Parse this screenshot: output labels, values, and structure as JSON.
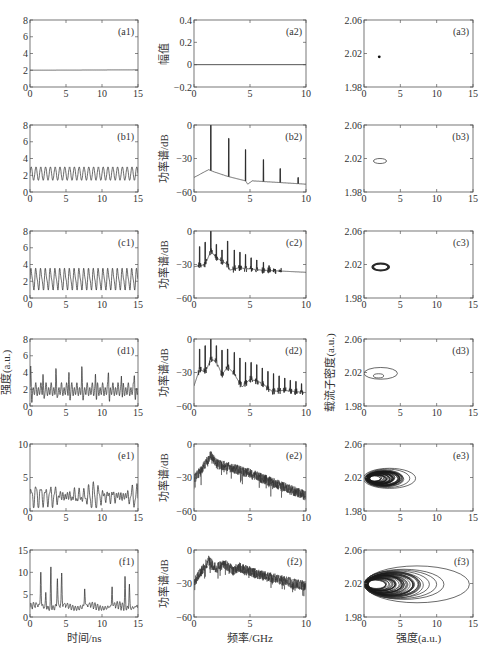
{
  "figure": {
    "rows": [
      "a",
      "b",
      "c",
      "d",
      "e",
      "f"
    ],
    "row_tops": [
      20,
      125,
      231,
      339,
      444,
      550
    ],
    "plot_height": 67,
    "columns": [
      {
        "left": 30,
        "width": 108,
        "type": "time_series",
        "xlabel": "时间/ns",
        "xticks": [
          0,
          5,
          10,
          15
        ],
        "xlim": [
          0,
          15
        ]
      },
      {
        "left": 194,
        "width": 112,
        "type": "power_spectrum",
        "xlabel": "频率/GHz",
        "xticks": [
          0,
          5,
          10
        ],
        "xlim": [
          0,
          10
        ]
      },
      {
        "left": 364,
        "width": 109,
        "type": "phase_portrait",
        "xlabel": "强度(a.u.)",
        "xticks": [
          0,
          5,
          10,
          15
        ],
        "xlim": [
          0,
          15
        ]
      }
    ]
  },
  "chart_data": [
    {
      "id": "a1",
      "type": "line",
      "panel_label": "(a1)",
      "xlabel": "",
      "ylabel": "",
      "xlim": [
        0,
        15
      ],
      "ylim": [
        0,
        8
      ],
      "yticks": [
        0,
        2,
        4,
        6,
        8
      ],
      "xticks": [
        0,
        5,
        10,
        15
      ],
      "description": "constant intensity",
      "series": [
        {
          "name": "intensity",
          "x": [
            0,
            15
          ],
          "y": [
            2.0,
            2.05
          ]
        }
      ]
    },
    {
      "id": "a2",
      "type": "line",
      "panel_label": "(a2)",
      "ylabel": "幅值",
      "xlim": [
        0,
        10
      ],
      "ylim": [
        -0.2,
        0.4
      ],
      "yticks": [
        -0.2,
        0,
        0.2,
        0.4
      ],
      "xticks": [
        0,
        5,
        10
      ],
      "series": [
        {
          "name": "amplitude",
          "x": [
            0,
            10
          ],
          "y": [
            0,
            0
          ]
        }
      ]
    },
    {
      "id": "a3",
      "type": "scatter",
      "panel_label": "(a3)",
      "xlim": [
        0,
        15
      ],
      "ylim": [
        1.98,
        2.06
      ],
      "yticks": [
        1.98,
        2.02,
        2.06
      ],
      "xticks": [
        0,
        5,
        10,
        15
      ],
      "series": [
        {
          "name": "fixed point",
          "x": [
            2.1
          ],
          "y": [
            2.016
          ]
        }
      ]
    },
    {
      "id": "b1",
      "type": "line",
      "panel_label": "(b1)",
      "xlim": [
        0,
        15
      ],
      "ylim": [
        0,
        8
      ],
      "yticks": [
        0,
        2,
        4,
        6,
        8
      ],
      "xticks": [
        0,
        5,
        10,
        15
      ],
      "description": "period-1 oscillation",
      "oscillation": {
        "min": 1.4,
        "max": 3.0,
        "frequency_ghz": 1.5
      }
    },
    {
      "id": "b2",
      "type": "line",
      "panel_label": "(b2)",
      "ylabel": "功率谱/dB",
      "xlim": [
        0,
        10
      ],
      "ylim": [
        -60,
        0
      ],
      "yticks": [
        -60,
        -30,
        0
      ],
      "xticks": [
        0,
        5,
        10
      ],
      "peaks": [
        {
          "f": 1.5,
          "db": 0
        },
        {
          "f": 3.1,
          "db": -12
        },
        {
          "f": 4.6,
          "db": -22
        },
        {
          "f": 6.2,
          "db": -31
        },
        {
          "f": 7.7,
          "db": -39
        },
        {
          "f": 9.3,
          "db": -47
        }
      ],
      "floor": [
        {
          "f": 0,
          "db": -47
        },
        {
          "f": 1.3,
          "db": -40
        },
        {
          "f": 1.8,
          "db": -42
        },
        {
          "f": 3.0,
          "db": -46
        },
        {
          "f": 4.6,
          "db": -50
        },
        {
          "f": 4.8,
          "db": -53
        },
        {
          "f": 5.2,
          "db": -50
        },
        {
          "f": 10,
          "db": -53
        }
      ]
    },
    {
      "id": "b3",
      "type": "line",
      "panel_label": "(b3)",
      "xlim": [
        0,
        15
      ],
      "ylim": [
        1.98,
        2.06
      ],
      "yticks": [
        1.98,
        2.02,
        2.06
      ],
      "xticks": [
        0,
        5,
        10,
        15
      ],
      "orbits": [
        {
          "cx": 2.2,
          "cy": 2.017,
          "rx": 0.9,
          "ry": 0.003
        }
      ]
    },
    {
      "id": "c1",
      "type": "line",
      "panel_label": "(c1)",
      "xlim": [
        0,
        15
      ],
      "ylim": [
        0,
        8
      ],
      "yticks": [
        0,
        2,
        4,
        6,
        8
      ],
      "xticks": [
        0,
        5,
        10,
        15
      ],
      "description": "period-1 oscillation larger amplitude",
      "oscillation": {
        "min": 1.1,
        "max": 3.4,
        "frequency_ghz": 1.5
      }
    },
    {
      "id": "c2",
      "type": "line",
      "panel_label": "(c2)",
      "ylabel": "功率谱/dB",
      "xlim": [
        0,
        10
      ],
      "ylim": [
        -60,
        0
      ],
      "yticks": [
        -60,
        -30,
        0
      ],
      "xticks": [
        0,
        5,
        10
      ],
      "peaks": [
        {
          "f": 0.5,
          "db": -14
        },
        {
          "f": 1.0,
          "db": -10
        },
        {
          "f": 1.5,
          "db": 0
        },
        {
          "f": 2.0,
          "db": -12
        },
        {
          "f": 2.5,
          "db": -17
        },
        {
          "f": 3.0,
          "db": -9
        },
        {
          "f": 3.6,
          "db": -17
        },
        {
          "f": 4.1,
          "db": -19
        },
        {
          "f": 4.6,
          "db": -21
        },
        {
          "f": 5.1,
          "db": -24
        },
        {
          "f": 5.6,
          "db": -26
        },
        {
          "f": 6.2,
          "db": -28
        },
        {
          "f": 6.7,
          "db": -31
        },
        {
          "f": 7.2,
          "db": -34
        },
        {
          "f": 7.7,
          "db": -35
        }
      ],
      "floor": [
        {
          "f": 0,
          "db": -32
        },
        {
          "f": 1.0,
          "db": -30
        },
        {
          "f": 1.5,
          "db": -18
        },
        {
          "f": 2.0,
          "db": -24
        },
        {
          "f": 3.0,
          "db": -30
        },
        {
          "f": 3.2,
          "db": -35
        },
        {
          "f": 4,
          "db": -33
        },
        {
          "f": 6,
          "db": -35
        },
        {
          "f": 10,
          "db": -37
        }
      ]
    },
    {
      "id": "c3",
      "type": "line",
      "panel_label": "(c3)",
      "xlim": [
        0,
        15
      ],
      "ylim": [
        1.98,
        2.06
      ],
      "yticks": [
        1.98,
        2.02,
        2.06
      ],
      "xticks": [
        0,
        5,
        10,
        15
      ],
      "orbits": [
        {
          "cx": 2.3,
          "cy": 2.017,
          "rx": 1.1,
          "ry": 0.004
        },
        {
          "cx": 2.3,
          "cy": 2.017,
          "rx": 1.2,
          "ry": 0.0045
        },
        {
          "cx": 2.3,
          "cy": 2.017,
          "rx": 1.0,
          "ry": 0.0038
        }
      ]
    },
    {
      "id": "d1",
      "type": "line",
      "panel_label": "(d1)",
      "ylabel": "强度(a.u.)",
      "xlim": [
        0,
        15
      ],
      "ylim": [
        0,
        8
      ],
      "yticks": [
        0,
        2,
        4,
        6,
        8
      ],
      "xticks": [
        0,
        5,
        10,
        15
      ],
      "description": "period doubling with spikes",
      "spike_times": [
        0.1,
        1.8,
        3.6,
        5.4,
        7.2,
        9.1,
        10.9,
        12.7,
        14.5
      ],
      "spike_height": 4.2,
      "base": {
        "min": 1.0,
        "max": 2.8
      }
    },
    {
      "id": "d2",
      "type": "line",
      "panel_label": "(d2)",
      "ylabel": "功率谱/dB",
      "xlim": [
        0,
        10
      ],
      "ylim": [
        -60,
        0
      ],
      "yticks": [
        -60,
        -30,
        0
      ],
      "xticks": [
        0,
        5,
        10
      ],
      "peaks": [
        {
          "f": 0.5,
          "db": -9
        },
        {
          "f": 1.0,
          "db": -6
        },
        {
          "f": 1.5,
          "db": 0
        },
        {
          "f": 2.0,
          "db": -6
        },
        {
          "f": 2.5,
          "db": -10
        },
        {
          "f": 3.0,
          "db": -9
        },
        {
          "f": 3.6,
          "db": -12
        },
        {
          "f": 4.1,
          "db": -17
        },
        {
          "f": 4.6,
          "db": -21
        },
        {
          "f": 5.1,
          "db": -21
        },
        {
          "f": 5.6,
          "db": -23
        },
        {
          "f": 6.1,
          "db": -26
        },
        {
          "f": 6.6,
          "db": -29
        },
        {
          "f": 7.1,
          "db": -31
        },
        {
          "f": 7.6,
          "db": -33
        },
        {
          "f": 8.1,
          "db": -35
        },
        {
          "f": 8.6,
          "db": -37
        },
        {
          "f": 9.1,
          "db": -38
        },
        {
          "f": 9.6,
          "db": -40
        }
      ],
      "floor": [
        {
          "f": 0,
          "db": -42
        },
        {
          "f": 0.5,
          "db": -27
        },
        {
          "f": 1,
          "db": -30
        },
        {
          "f": 1.5,
          "db": -18
        },
        {
          "f": 2,
          "db": -20
        },
        {
          "f": 2.5,
          "db": -32
        },
        {
          "f": 3,
          "db": -25
        },
        {
          "f": 3.5,
          "db": -30
        },
        {
          "f": 4.3,
          "db": -43
        },
        {
          "f": 5,
          "db": -36
        },
        {
          "f": 6,
          "db": -39
        },
        {
          "f": 7,
          "db": -47
        },
        {
          "f": 8,
          "db": -46
        },
        {
          "f": 10,
          "db": -48
        }
      ]
    },
    {
      "id": "d3",
      "type": "line",
      "panel_label": "(d3)",
      "ylabel": "载流子密度(a.u.)",
      "xlim": [
        0,
        15
      ],
      "ylim": [
        1.98,
        2.06
      ],
      "yticks": [
        1.98,
        2.02,
        2.06
      ],
      "xticks": [
        0,
        5,
        10,
        15
      ],
      "orbits": [
        {
          "cx": 2.3,
          "cy": 2.019,
          "rx": 2.3,
          "ry": 0.007
        },
        {
          "cx": 2.0,
          "cy": 2.016,
          "rx": 0.7,
          "ry": 0.0025
        }
      ]
    },
    {
      "id": "e1",
      "type": "line",
      "panel_label": "(e1)",
      "xlim": [
        0,
        15
      ],
      "ylim": [
        0,
        10
      ],
      "yticks": [
        0,
        5,
        10
      ],
      "xticks": [
        0,
        5,
        10,
        15
      ],
      "description": "chaotic intensity",
      "range": {
        "min": 0.5,
        "max": 5.0
      }
    },
    {
      "id": "e2",
      "type": "line",
      "panel_label": "(e2)",
      "ylabel": "功率谱/dB",
      "xlim": [
        0,
        10
      ],
      "ylim": [
        -60,
        0
      ],
      "yticks": [
        -60,
        -30,
        0
      ],
      "xticks": [
        0,
        5,
        10
      ],
      "envelope": [
        {
          "f": 0,
          "db": -27
        },
        {
          "f": 0.7,
          "db": -18
        },
        {
          "f": 1.5,
          "db": -6
        },
        {
          "f": 2,
          "db": -13
        },
        {
          "f": 3,
          "db": -16
        },
        {
          "f": 5,
          "db": -22
        },
        {
          "f": 7,
          "db": -30
        },
        {
          "f": 10,
          "db": -42
        }
      ]
    },
    {
      "id": "e3",
      "type": "line",
      "panel_label": "(e3)",
      "xlim": [
        0,
        15
      ],
      "ylim": [
        1.98,
        2.06
      ],
      "yticks": [
        1.98,
        2.02,
        2.06
      ],
      "xticks": [
        0,
        5,
        10,
        15
      ],
      "orbits": [
        {
          "cx": 3.5,
          "cy": 2.019,
          "rx": 3.6,
          "ry": 0.012
        },
        {
          "cx": 3.2,
          "cy": 2.019,
          "rx": 3.1,
          "ry": 0.011
        },
        {
          "cx": 2.8,
          "cy": 2.019,
          "rx": 2.6,
          "ry": 0.01
        }
      ],
      "dense_region": {
        "cx": 2.6,
        "cy": 2.019,
        "rx": 2.4,
        "ry": 0.009
      }
    },
    {
      "id": "f1",
      "type": "line",
      "panel_label": "(f1)",
      "xlabel": "时间/ns",
      "xlim": [
        0,
        15
      ],
      "ylim": [
        0,
        15
      ],
      "yticks": [
        0,
        5,
        10,
        15
      ],
      "xticks": [
        0,
        5,
        10,
        15
      ],
      "description": "chaotic intensity with large spikes",
      "spikes": [
        {
          "t": 1.5,
          "v": 9.8
        },
        {
          "t": 2.2,
          "v": 5.2
        },
        {
          "t": 2.9,
          "v": 11.0
        },
        {
          "t": 3.8,
          "v": 8.7
        },
        {
          "t": 4.4,
          "v": 9.0
        },
        {
          "t": 7.6,
          "v": 6.0
        },
        {
          "t": 11.4,
          "v": 6.0
        },
        {
          "t": 13.2,
          "v": 8.3
        },
        {
          "t": 13.8,
          "v": 7.5
        }
      ]
    },
    {
      "id": "f2",
      "type": "line",
      "panel_label": "(f2)",
      "xlabel": "频率/GHz",
      "ylabel": "功率谱/dB",
      "xlim": [
        0,
        10
      ],
      "ylim": [
        -60,
        0
      ],
      "yticks": [
        -60,
        -30,
        0
      ],
      "xticks": [
        0,
        5,
        10
      ],
      "envelope": [
        {
          "f": 0,
          "db": -24
        },
        {
          "f": 1.3,
          "db": -5
        },
        {
          "f": 2,
          "db": -12
        },
        {
          "f": 2.7,
          "db": -8
        },
        {
          "f": 3.5,
          "db": -14
        },
        {
          "f": 4,
          "db": -11
        },
        {
          "f": 6,
          "db": -18
        },
        {
          "f": 8,
          "db": -23
        },
        {
          "f": 10,
          "db": -28
        }
      ]
    },
    {
      "id": "f3",
      "type": "line",
      "panel_label": "(f3)",
      "xlabel": "强度(a.u.)",
      "xlim": [
        0,
        15
      ],
      "ylim": [
        1.98,
        2.06
      ],
      "yticks": [
        1.98,
        2.02,
        2.06
      ],
      "xticks": [
        0,
        5,
        10,
        15
      ],
      "orbits": [
        {
          "cx": 7.3,
          "cy": 2.019,
          "rx": 7.2,
          "ry": 0.022
        },
        {
          "cx": 5.5,
          "cy": 2.019,
          "rx": 5.5,
          "ry": 0.018
        },
        {
          "cx": 5.0,
          "cy": 2.019,
          "rx": 5.0,
          "ry": 0.017
        },
        {
          "cx": 4.5,
          "cy": 2.019,
          "rx": 4.5,
          "ry": 0.016
        }
      ],
      "dense_region": {
        "cx": 4.0,
        "cy": 2.019,
        "rx": 4.0,
        "ry": 0.016
      }
    }
  ]
}
